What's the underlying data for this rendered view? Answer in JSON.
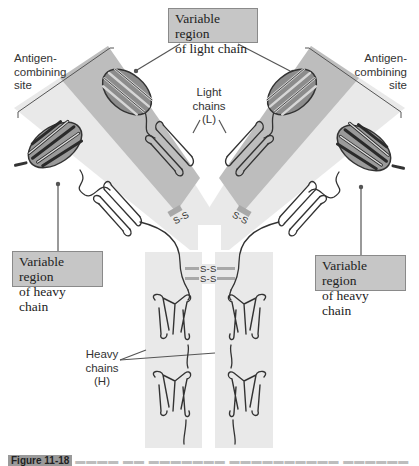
{
  "figure": {
    "colors": {
      "background": "#ffffff",
      "strip_light": "#e9e9e9",
      "strip_dark": "#b9b9b9",
      "label_box_fill": "#c6c6c6",
      "label_box_border": "#8a8a8a",
      "protein_dark": "#3a3a3a",
      "protein_mid": "#7a7a7a",
      "disulfide_band": "#a8a8a8"
    }
  },
  "labels": {
    "variable_light": {
      "line1": "Variable region",
      "line2": "of light chain"
    },
    "antigen_left": {
      "line1": "Antigen-",
      "line2": "combining",
      "line3": "site"
    },
    "antigen_right": {
      "line1": "Antigen-",
      "line2": "combining",
      "line3": "site"
    },
    "light_chains": {
      "line1": "Light",
      "line2": "chains",
      "line3": "(L)"
    },
    "variable_heavy_left": {
      "line1": "Variable region",
      "line2": "of heavy chain"
    },
    "variable_heavy_right": {
      "line1": "Variable region",
      "line2": "of heavy chain"
    },
    "heavy_chains": {
      "line1": "Heavy",
      "line2": "chains",
      "line3": "(H)"
    }
  },
  "bonds": {
    "arm_left": "S-S",
    "arm_right": "S-S",
    "hinge_upper": "S-S",
    "hinge_lower": "S-S"
  },
  "caption": {
    "figure_label": "Figure 11-18",
    "text_truncated": "▬▬▬▬ ▬▬ ▬▬▬▬▬▬▬ ▬▬▬▬▬▬▬▬▬▬ ▬▬▬▬▬▬"
  }
}
